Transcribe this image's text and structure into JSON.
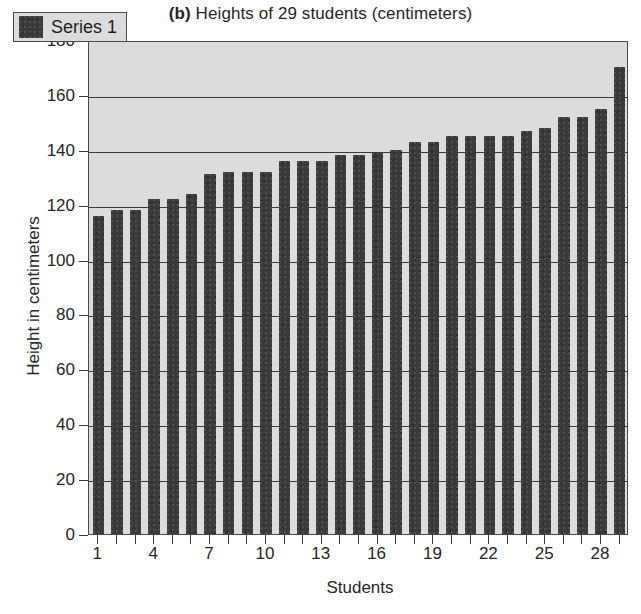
{
  "chart_data": {
    "type": "bar",
    "title": "(b) Heights of 29 students (centimeters)",
    "title_prefix": "(b)",
    "title_rest": " Heights of 29 students (centimeters)",
    "xlabel": "Students",
    "ylabel": "Height in centimeters",
    "ylim": [
      0,
      180
    ],
    "ytick_step": 20,
    "yticks": [
      180,
      160,
      140,
      120,
      100,
      80,
      60,
      40,
      20,
      0
    ],
    "xticks_labeled": [
      1,
      4,
      7,
      10,
      13,
      16,
      19,
      22,
      25,
      28
    ],
    "grid": true,
    "gridlines_at": [
      20,
      40,
      60,
      80,
      100,
      120,
      140,
      160
    ],
    "legend": {
      "position": "top-left-inside",
      "entries": [
        {
          "name": "Series 1",
          "color": "#3a3a3a"
        }
      ]
    },
    "categories": [
      1,
      2,
      3,
      4,
      5,
      6,
      7,
      8,
      9,
      10,
      11,
      12,
      13,
      14,
      15,
      16,
      17,
      18,
      19,
      20,
      21,
      22,
      23,
      24,
      25,
      26,
      27,
      28,
      29
    ],
    "series": [
      {
        "name": "Series 1",
        "color": "#3a3a3a",
        "values": [
          116,
          118,
          118,
          122,
          122,
          124,
          131,
          132,
          132,
          132,
          136,
          136,
          136,
          138,
          138,
          139,
          140,
          143,
          143,
          145,
          145,
          145,
          145,
          147,
          148,
          152,
          152,
          155,
          170
        ]
      }
    ]
  },
  "colors": {
    "plot_background": "#dcdcdc",
    "bar": "#3a3a3a",
    "axis": "#3a3a3a",
    "page_background": "#ffffff",
    "text": "#262626"
  }
}
